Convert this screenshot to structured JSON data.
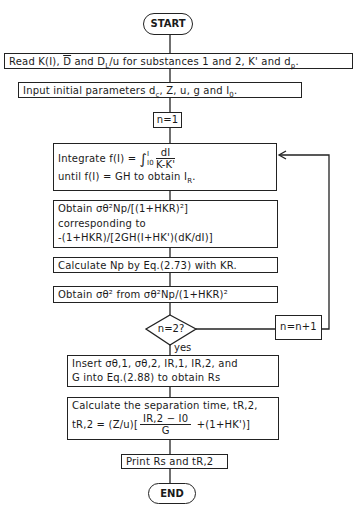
{
  "flowchart": {
    "start": "START",
    "end": "END",
    "read": "Read K(I), D̄ and D_L/u for substances 1 and 2, K' and d_p.",
    "read_parts": {
      "a": "Read K(I), ",
      "dbar": "D",
      "b": " and ",
      "dl": "D",
      "dl_sub": "L",
      "c": "/u for substances 1 and 2, K' and d",
      "dp_sub": "p",
      "d": "."
    },
    "input": {
      "a": "Input initial parameters d",
      "dc_sub": "c",
      "b": ", Z, u, g and I",
      "i0_sub": "0",
      "c": "."
    },
    "init_n": "n=1",
    "integrate": {
      "line1_a": "Integrate f(I) = ",
      "upper": "I",
      "lower": "I0",
      "num": "dI",
      "den": "K-K'",
      "line2_a": "until f(I) = GH to obtain I",
      "line2_sub": "R",
      "line2_b": "."
    },
    "obtain1": {
      "line1": "Obtain σθ²Np/[(1+HKR)²]",
      "line2": "corresponding to",
      "line3": "-(1+HKR)/[2GH(I+HK')(dK/dI)]"
    },
    "calc_np": "Calculate Np by Eq.(2.73) with KR.",
    "obtain2": "Obtain σθ² from σθ²Np/(1+HKR)²",
    "decision": "n=2?",
    "yes_label": "yes",
    "increment": "n=n+1",
    "insert": {
      "line1": "Insert σθ,1, σθ,2, IR,1, IR,2, and",
      "line2": "G into Eq.(2.88) to obtain Rs"
    },
    "separation": {
      "line1": "Calculate the separation time, tR,2,",
      "line2_a": "tR,2 = (Z/u)[",
      "num": "IR,2 − I0",
      "den": "G",
      "line2_b": " +(1+HK')]"
    },
    "print": "Print Rs and tR,2"
  }
}
